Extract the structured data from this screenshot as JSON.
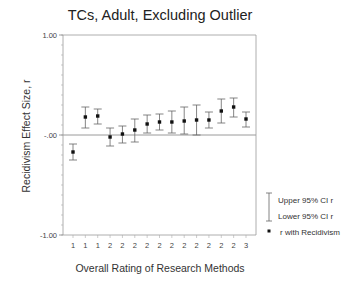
{
  "chart_data": {
    "type": "scatter",
    "subtype": "error-bar",
    "title": "TCs, Adult, Excluding Outlier",
    "xlabel": "Overall Rating of Research Methods",
    "ylabel": "Recidivism Effect Size, r",
    "ylim": [
      -1.0,
      1.0
    ],
    "y_ticks": [
      {
        "value": 1.0,
        "label": "1.00"
      },
      {
        "value": 0.0,
        "label": "-.00"
      },
      {
        "value": -1.0,
        "label": "-1.00"
      }
    ],
    "y_minor_step": 0.1,
    "reference_line": 0.0,
    "grid": false,
    "categories": [
      "1",
      "1",
      "1",
      "2",
      "2",
      "2",
      "2",
      "2",
      "2",
      "2",
      "2",
      "2",
      "2",
      "2",
      "3"
    ],
    "series": [
      {
        "name": "r with Recidivism",
        "values": [
          -0.17,
          0.18,
          0.19,
          -0.02,
          0.01,
          0.05,
          0.11,
          0.13,
          0.13,
          0.14,
          0.15,
          0.15,
          0.24,
          0.28,
          0.16
        ]
      },
      {
        "name": "Upper 95% CI r",
        "values": [
          -0.09,
          0.28,
          0.26,
          0.07,
          0.09,
          0.16,
          0.2,
          0.21,
          0.24,
          0.28,
          0.3,
          0.23,
          0.36,
          0.37,
          0.23
        ]
      },
      {
        "name": "Lower 95% CI r",
        "values": [
          -0.25,
          0.07,
          0.11,
          -0.11,
          -0.08,
          -0.07,
          0.02,
          0.05,
          0.02,
          0.01,
          0.0,
          0.07,
          0.12,
          0.18,
          0.08
        ]
      }
    ],
    "legend": {
      "placement": "bottom-right",
      "entries": [
        {
          "label": "Upper 95% CI r",
          "symbol": "whisker-top"
        },
        {
          "label": "Lower 95% CI r",
          "symbol": "whisker-bottom"
        },
        {
          "label": "r with Recidivism",
          "symbol": "dot"
        }
      ]
    },
    "colors": {
      "frame": "#9a9a9a",
      "marks": "#111111",
      "whisker": "#666666",
      "zero_line": "#9a9a9a"
    }
  }
}
